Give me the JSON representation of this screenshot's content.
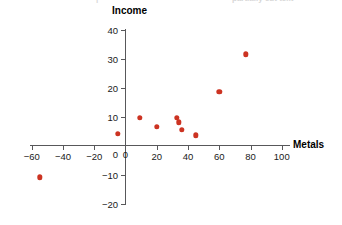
{
  "chart": {
    "axis_titles": {
      "x": "Metals",
      "y": "Income"
    },
    "marker_color": "#cc3322",
    "axis_color": "#58585a",
    "background": "#ffffff"
  },
  "top_bleed": {
    "left_fragment": "|",
    "right_fragment": "partially cut text"
  },
  "chart_data": {
    "type": "scatter",
    "title": "",
    "xlabel": "Metals",
    "ylabel": "Income",
    "xlim": [
      -70,
      105
    ],
    "ylim": [
      -22,
      42
    ],
    "grid": false,
    "legend": null,
    "x_ticks": [
      -60,
      -40,
      -20,
      0,
      20,
      40,
      60,
      80,
      100
    ],
    "x_tick_labels": [
      "−60",
      "−40",
      "−20",
      "0",
      "20",
      "40",
      "60",
      "80",
      "100"
    ],
    "y_ticks": [
      -20,
      -10,
      0,
      10,
      20,
      30,
      40
    ],
    "y_tick_labels": [
      "−20",
      "−10",
      "0",
      "10",
      "20",
      "30",
      "40"
    ],
    "series": [
      {
        "name": "Countries",
        "color": "#cc3322",
        "points": [
          {
            "x": -55,
            "y": -11
          },
          {
            "x": -5,
            "y": 4
          },
          {
            "x": 9,
            "y": 9.5
          },
          {
            "x": 20,
            "y": 6.5
          },
          {
            "x": 33,
            "y": 9.5
          },
          {
            "x": 34,
            "y": 8
          },
          {
            "x": 36,
            "y": 5.5
          },
          {
            "x": 45,
            "y": 3.5
          },
          {
            "x": 60,
            "y": 18.5
          },
          {
            "x": 77,
            "y": 31.5
          }
        ]
      }
    ]
  }
}
